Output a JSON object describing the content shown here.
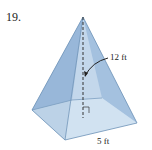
{
  "problem_number": "19.",
  "labels": {
    "height": "12 ft",
    "base_side": "5 ft"
  },
  "colors": {
    "face_left": "#8fb3d6",
    "face_front": "#a9c7e3",
    "face_right": "#c3d8ec",
    "base": "#dbe9f5",
    "edge": "#6f93b8"
  }
}
